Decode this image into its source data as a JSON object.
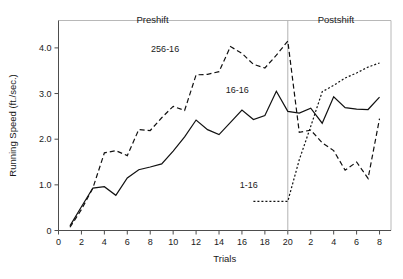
{
  "chart_data": {
    "type": "line",
    "title": "",
    "xlabel": "Trials",
    "ylabel": "Running Speed (ft./sec.)",
    "ylim": [
      0,
      4.6
    ],
    "ytick_values": [
      0,
      1.0,
      2.0,
      3.0,
      4.0
    ],
    "ytick_labels": [
      "0",
      "1.0",
      "2.0",
      "3.0",
      "4.0"
    ],
    "xtick_values": [
      0,
      2,
      4,
      6,
      8,
      10,
      12,
      14,
      16,
      18,
      20,
      22,
      24,
      26,
      28
    ],
    "xtick_labels": [
      "0",
      "2",
      "4",
      "6",
      "8",
      "10",
      "12",
      "14",
      "16",
      "18",
      "20",
      "2",
      "4",
      "6",
      "8"
    ],
    "xlim": [
      0,
      29
    ],
    "grid": false,
    "legend_position": "inline-annotations",
    "phase_divider_x": 20,
    "annotations": [
      {
        "text": "Preshift",
        "x": 8.2,
        "y": 4.55,
        "name": "preshift-label"
      },
      {
        "text": "Postshift",
        "x": 24.2,
        "y": 4.55,
        "name": "postshift-label"
      },
      {
        "text": "256-16",
        "x": 9.3,
        "y": 3.92,
        "name": "series-label-256-16"
      },
      {
        "text": "16-16",
        "x": 15.6,
        "y": 3.02,
        "name": "series-label-16-16"
      },
      {
        "text": "1-16",
        "x": 16.6,
        "y": 0.94,
        "name": "series-label-1-16"
      }
    ],
    "series": [
      {
        "name": "16-16",
        "style": "solid",
        "x": [
          1,
          2,
          3,
          4,
          5,
          6,
          7,
          8,
          9,
          10,
          11,
          12,
          13,
          14,
          15,
          16,
          17,
          18,
          19,
          20,
          21,
          22,
          23,
          24,
          25,
          26,
          27,
          28
        ],
        "values": [
          0.1,
          0.52,
          0.93,
          0.96,
          0.77,
          1.15,
          1.33,
          1.39,
          1.46,
          1.74,
          2.05,
          2.42,
          2.21,
          2.1,
          2.37,
          2.64,
          2.43,
          2.52,
          3.05,
          2.61,
          2.57,
          2.68,
          2.35,
          2.93,
          2.69,
          2.66,
          2.65,
          2.92
        ]
      },
      {
        "name": "256-16",
        "style": "dashed",
        "x": [
          1,
          2,
          3,
          4,
          5,
          6,
          7,
          8,
          9,
          10,
          11,
          12,
          13,
          14,
          15,
          16,
          17,
          18,
          19,
          20,
          21,
          22,
          23,
          24,
          25,
          26,
          27,
          28
        ],
        "values": [
          0.07,
          0.46,
          0.93,
          1.7,
          1.75,
          1.64,
          2.21,
          2.19,
          2.47,
          2.72,
          2.63,
          3.41,
          3.42,
          3.48,
          4.03,
          3.88,
          3.64,
          3.56,
          3.84,
          4.15,
          2.15,
          2.2,
          1.92,
          1.75,
          1.32,
          1.5,
          1.14,
          2.45
        ]
      },
      {
        "name": "1-16",
        "style": "dotted",
        "x": [
          17,
          18,
          19,
          20,
          21,
          22,
          23,
          24,
          25,
          26,
          27,
          28
        ],
        "values": [
          0.64,
          0.64,
          0.64,
          0.64,
          1.55,
          2.28,
          3.04,
          3.18,
          3.34,
          3.45,
          3.58,
          3.67
        ]
      }
    ]
  }
}
